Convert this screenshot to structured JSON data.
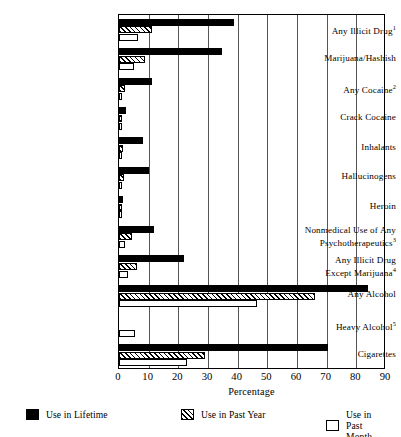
{
  "chart_data": {
    "type": "bar",
    "orientation": "horizontal",
    "title": "",
    "xlabel": "Percentage",
    "ylabel": "",
    "xlim": [
      0,
      90
    ],
    "xticks": [
      0,
      10,
      20,
      30,
      40,
      50,
      60,
      70,
      80,
      90
    ],
    "grid": true,
    "legend_position": "bottom",
    "categories": [
      "Any Illicit Drug<sup>1</sup>",
      "Marijuana/Hashish",
      "Any Cocaine<sup>2</sup>",
      "Crack Cocaine",
      "Inhalants",
      "Hallucinogens",
      "Heroin",
      "Nonmedical Use of Any\nPsychotherapeutics<sup>3</sup>",
      "Any Illicit Drug\nExcept Marijuana<sup>4</sup>",
      "Any Alcohol",
      "Heavy Alcohol<sup>5</sup>",
      "Cigarettes"
    ],
    "series": [
      {
        "name": "Use in Lifetime",
        "style": "solid-black",
        "values": [
          38.9,
          34.6,
          11.2,
          2.5,
          8.2,
          10.0,
          1.4,
          11.8,
          21.9,
          83.9,
          0,
          70.4
        ]
      },
      {
        "name": "Use in Past Year",
        "style": "hatched",
        "values": [
          11.2,
          8.9,
          1.9,
          0.6,
          1.4,
          1.7,
          0.2,
          4.4,
          6.2,
          66.1,
          0,
          29.0
        ]
      },
      {
        "name": "Use in Past Month",
        "style": "white-outline",
        "values": [
          6.4,
          5.1,
          0.8,
          0.3,
          0.6,
          0.6,
          0.1,
          2.0,
          3.0,
          46.4,
          5.4,
          22.8
        ]
      }
    ]
  },
  "legend": [
    {
      "label": "Use in Lifetime",
      "style": "lifetime"
    },
    {
      "label": "Use in Past Year",
      "style": "pastyear"
    },
    {
      "label": "Use in Past Month",
      "style": "pastmonth"
    }
  ]
}
